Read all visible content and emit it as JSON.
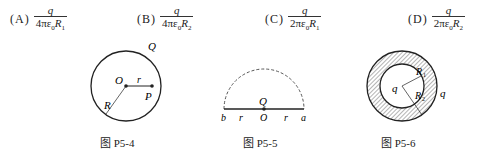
{
  "options": [
    {
      "label": "(A)",
      "numerator": "q",
      "den_coef": "4πε",
      "den_sub0": "0",
      "den_var": "R",
      "den_sub": "1"
    },
    {
      "label": "(B)",
      "numerator": "q",
      "den_coef": "4πε",
      "den_sub0": "0",
      "den_var": "R",
      "den_sub": "2"
    },
    {
      "label": "(C)",
      "numerator": "q",
      "den_coef": "2πε",
      "den_sub0": "0",
      "den_var": "R",
      "den_sub": "1"
    },
    {
      "label": "(D)",
      "numerator": "q",
      "den_coef": "2πε",
      "den_sub0": "0",
      "den_var": "R",
      "den_sub": "2"
    }
  ],
  "figures": {
    "fig1": {
      "caption": "图 P5-4",
      "labels": {
        "Q": "Q",
        "O": "O",
        "r": "r",
        "P": "P",
        "R": "R"
      }
    },
    "fig2": {
      "caption": "图 P5-5",
      "labels": {
        "Q": "Q",
        "b": "b",
        "r1": "r",
        "O": "O",
        "r2": "r",
        "a": "a"
      }
    },
    "fig3": {
      "caption": "图 P5-6",
      "labels": {
        "q_inner": "q",
        "R1": "R",
        "R1_sub": "1",
        "R2": "R",
        "R2_sub": "2",
        "q_outer": "q"
      }
    }
  }
}
